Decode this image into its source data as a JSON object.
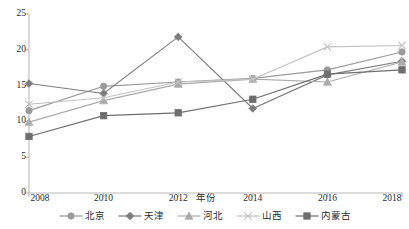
{
  "chart_data": {
    "type": "line",
    "title": "",
    "subtitle": "",
    "xlabel": "年份",
    "ylabel": "",
    "x": [
      2008,
      2010,
      2012,
      2014,
      2016,
      2018
    ],
    "categories": [
      "2008",
      "2010",
      "2012",
      "2014",
      "2016",
      "2018"
    ],
    "xlim": [
      2008,
      2018
    ],
    "ylim": [
      0,
      25
    ],
    "y_ticks": [
      0,
      5,
      10,
      15,
      20,
      25
    ],
    "y_tick_labels": [
      "0",
      "5",
      "10",
      "15",
      "20",
      "25"
    ],
    "x_tick_labels": [
      "2008",
      "2010",
      "2012",
      "2014",
      "2016",
      "2018"
    ],
    "grid": false,
    "legend_position": "bottom",
    "series": [
      {
        "name": "北京",
        "marker": "circle",
        "color": "#9a9a9a",
        "values": [
          11.5,
          14.9,
          15.5,
          16.0,
          17.2,
          19.7
        ]
      },
      {
        "name": "天津",
        "marker": "diamond",
        "color": "#7c7c7c",
        "values": [
          15.3,
          13.9,
          21.8,
          11.8,
          16.5,
          18.4
        ]
      },
      {
        "name": "河北",
        "marker": "triangle",
        "color": "#ababab",
        "values": [
          9.9,
          12.9,
          15.2,
          15.9,
          15.5,
          18.3
        ]
      },
      {
        "name": "山西",
        "marker": "x",
        "color": "#c2c2c2",
        "values": [
          12.4,
          13.3,
          15.5,
          15.9,
          20.4,
          20.6
        ]
      },
      {
        "name": "内蒙古",
        "marker": "square",
        "color": "#6e6e6e",
        "values": [
          7.9,
          10.8,
          11.2,
          13.1,
          16.6,
          17.2
        ]
      }
    ]
  },
  "axis": {
    "line_color": "#b9b9b9",
    "text_color": "#2b2b2b"
  },
  "legend": {
    "items": [
      {
        "label": "北京"
      },
      {
        "label": "天津"
      },
      {
        "label": "河北"
      },
      {
        "label": "山西"
      },
      {
        "label": "内蒙古"
      }
    ]
  }
}
